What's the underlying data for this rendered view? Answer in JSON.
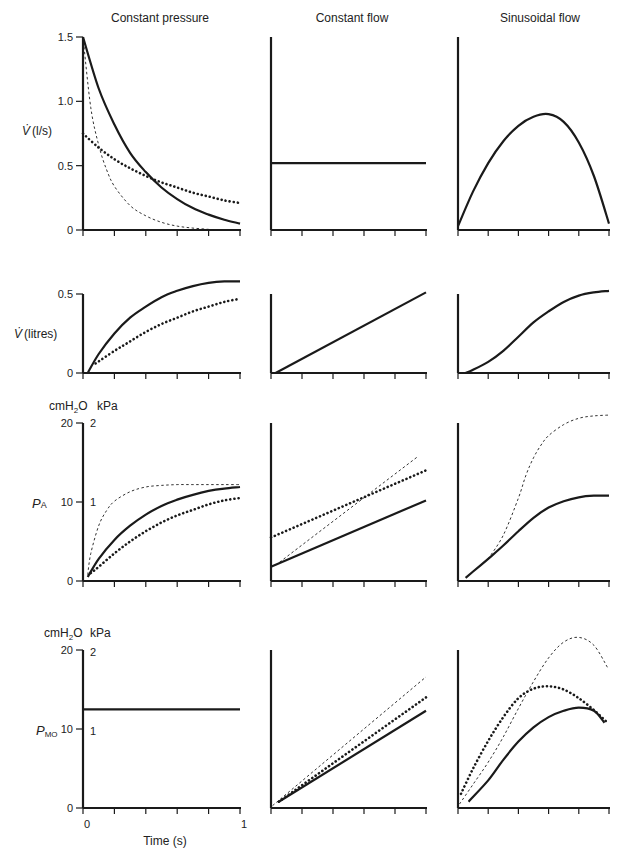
{
  "figure": {
    "column_titles": [
      "Constant pressure",
      "Constant flow",
      "Sinusoidal flow"
    ],
    "x_axis": {
      "label": "Time (s)",
      "tick_min_label": "0",
      "tick_max_label": "1",
      "ticks": 6
    },
    "row_labels": [
      {
        "main": "V̇ (l/s)",
        "units_left": "",
        "units_right": ""
      },
      {
        "main": "V̇ (litres)",
        "units_left": "",
        "units_right": ""
      },
      {
        "main": "P",
        "sub": "A",
        "units_left": "cmH₂O",
        "units_right": "kPa"
      },
      {
        "main": "P",
        "sub": "MO",
        "units_left": "cmH₂O",
        "units_right": "kPa"
      }
    ],
    "colors": {
      "ink": "#1a1a1a",
      "background": "#ffffff"
    }
  },
  "chart_data": {
    "type": "line",
    "title": "",
    "layout": "4 rows x 3 columns small multiples",
    "columns": [
      "Constant pressure",
      "Constant flow",
      "Sinusoidal flow"
    ],
    "xlabel": "Time (s)",
    "xlim": [
      0,
      1
    ],
    "line_styles": {
      "solid": "thick solid",
      "dotted": "thick dotted",
      "dashed": "thin dashed"
    },
    "rows": [
      {
        "ylabel": "V̇ (l/s)",
        "ylim": [
          0,
          1.5
        ],
        "yticks": [
          0,
          0.5,
          1.0,
          1.5
        ],
        "ytick_labels": [
          "0",
          "0.5",
          "1.0",
          "1.5"
        ],
        "panels": [
          {
            "series": [
              {
                "style": "solid",
                "x": [
                  0,
                  0.1,
                  0.2,
                  0.3,
                  0.4,
                  0.5,
                  0.6,
                  0.7,
                  0.8,
                  0.9,
                  1.0
                ],
                "y": [
                  1.5,
                  1.1,
                  0.82,
                  0.6,
                  0.45,
                  0.33,
                  0.24,
                  0.17,
                  0.12,
                  0.08,
                  0.05
                ]
              },
              {
                "style": "dotted",
                "x": [
                  0,
                  0.1,
                  0.2,
                  0.3,
                  0.4,
                  0.5,
                  0.6,
                  0.7,
                  0.8,
                  0.9,
                  1.0
                ],
                "y": [
                  0.75,
                  0.64,
                  0.55,
                  0.48,
                  0.42,
                  0.37,
                  0.33,
                  0.29,
                  0.26,
                  0.23,
                  0.21
                ]
              },
              {
                "style": "dashed",
                "x": [
                  0,
                  0.05,
                  0.1,
                  0.15,
                  0.2,
                  0.3,
                  0.4,
                  0.5,
                  0.6,
                  0.7,
                  0.8,
                  0.85
                ],
                "y": [
                  1.5,
                  0.95,
                  0.66,
                  0.47,
                  0.34,
                  0.19,
                  0.11,
                  0.06,
                  0.03,
                  0.015,
                  0.005,
                  0
                ]
              }
            ]
          },
          {
            "series": [
              {
                "style": "solid",
                "x": [
                  0,
                  1
                ],
                "y": [
                  0.52,
                  0.52
                ]
              }
            ]
          },
          {
            "series": [
              {
                "style": "solid",
                "x": [
                  0,
                  0.1,
                  0.2,
                  0.3,
                  0.4,
                  0.5,
                  0.6,
                  0.7,
                  0.8,
                  0.9,
                  1.0
                ],
                "y": [
                  0.03,
                  0.3,
                  0.52,
                  0.69,
                  0.81,
                  0.88,
                  0.9,
                  0.84,
                  0.68,
                  0.42,
                  0.05
                ]
              }
            ]
          }
        ]
      },
      {
        "ylabel": "V̇ (litres)",
        "ylim": [
          0,
          0.5
        ],
        "yticks": [
          0,
          0.5
        ],
        "ytick_labels": [
          "0",
          "0.5"
        ],
        "panels": [
          {
            "series": [
              {
                "style": "solid",
                "x": [
                  0.03,
                  0.1,
                  0.2,
                  0.3,
                  0.4,
                  0.5,
                  0.6,
                  0.7,
                  0.8,
                  0.9,
                  1.0
                ],
                "y": [
                  0.0,
                  0.12,
                  0.25,
                  0.35,
                  0.42,
                  0.48,
                  0.52,
                  0.55,
                  0.57,
                  0.58,
                  0.58
                ]
              },
              {
                "style": "dotted",
                "x": [
                  0.08,
                  0.2,
                  0.3,
                  0.4,
                  0.5,
                  0.6,
                  0.7,
                  0.8,
                  0.9,
                  1.0
                ],
                "y": [
                  0.06,
                  0.14,
                  0.2,
                  0.26,
                  0.31,
                  0.35,
                  0.39,
                  0.42,
                  0.45,
                  0.47
                ]
              }
            ]
          },
          {
            "series": [
              {
                "style": "solid",
                "x": [
                  0.03,
                  1
                ],
                "y": [
                  0,
                  0.51
                ]
              }
            ]
          },
          {
            "series": [
              {
                "style": "solid",
                "x": [
                  0.05,
                  0.1,
                  0.2,
                  0.3,
                  0.4,
                  0.5,
                  0.6,
                  0.7,
                  0.8,
                  0.9,
                  1.0
                ],
                "y": [
                  0,
                  0.02,
                  0.07,
                  0.14,
                  0.23,
                  0.32,
                  0.39,
                  0.45,
                  0.49,
                  0.51,
                  0.52
                ]
              }
            ]
          }
        ]
      },
      {
        "ylabel": "PA",
        "ylabel_units": [
          "cmH2O",
          "kPa"
        ],
        "ylim": [
          0,
          20
        ],
        "yticks": [
          0,
          10,
          20
        ],
        "ytick_labels": [
          "0",
          "10",
          "20"
        ],
        "ytick_labels_right": [
          "",
          "1",
          "2"
        ],
        "panels": [
          {
            "series": [
              {
                "style": "solid",
                "x": [
                  0.03,
                  0.1,
                  0.2,
                  0.3,
                  0.4,
                  0.5,
                  0.6,
                  0.7,
                  0.8,
                  0.9,
                  1.0
                ],
                "y": [
                  0.5,
                  2.8,
                  5.2,
                  7.0,
                  8.4,
                  9.5,
                  10.3,
                  10.9,
                  11.4,
                  11.7,
                  11.9
                ]
              },
              {
                "style": "dotted",
                "x": [
                  0.05,
                  0.1,
                  0.2,
                  0.3,
                  0.4,
                  0.5,
                  0.6,
                  0.7,
                  0.8,
                  0.9,
                  1.0
                ],
                "y": [
                  1.0,
                  1.8,
                  3.5,
                  5.0,
                  6.3,
                  7.4,
                  8.3,
                  9.0,
                  9.7,
                  10.2,
                  10.5
                ]
              },
              {
                "style": "dashed",
                "x": [
                  0.03,
                  0.05,
                  0.1,
                  0.15,
                  0.2,
                  0.3,
                  0.4,
                  0.5,
                  0.6,
                  0.7,
                  0.8,
                  0.9,
                  1.0
                ],
                "y": [
                  0.8,
                  3.5,
                  7.0,
                  8.9,
                  10.1,
                  11.3,
                  11.9,
                  12.1,
                  12.2,
                  12.2,
                  12.2,
                  12.2,
                  12.2
                ]
              }
            ]
          },
          {
            "series": [
              {
                "style": "solid",
                "x": [
                  0,
                  1
                ],
                "y": [
                  1.8,
                  10.2
                ]
              },
              {
                "style": "dotted",
                "x": [
                  0,
                  1
                ],
                "y": [
                  5.5,
                  14.0
                ]
              },
              {
                "style": "dashed",
                "x": [
                  0.03,
                  0.95
                ],
                "y": [
                  2.0,
                  15.8
                ]
              }
            ]
          },
          {
            "series": [
              {
                "style": "solid",
                "x": [
                  0.05,
                  0.1,
                  0.2,
                  0.3,
                  0.4,
                  0.5,
                  0.6,
                  0.7,
                  0.8,
                  0.9,
                  1.0
                ],
                "y": [
                  0.4,
                  1.2,
                  2.8,
                  4.5,
                  6.3,
                  8.0,
                  9.3,
                  10.1,
                  10.6,
                  10.8,
                  10.8
                ]
              },
              {
                "style": "dashed",
                "x": [
                  0.2,
                  0.3,
                  0.4,
                  0.45,
                  0.5,
                  0.55,
                  0.6,
                  0.7,
                  0.8,
                  0.9,
                  1.0
                ],
                "y": [
                  2.8,
                  5.8,
                  10.5,
                  13.4,
                  15.6,
                  17.2,
                  18.4,
                  19.8,
                  20.6,
                  20.9,
                  21.0
                ]
              }
            ]
          }
        ]
      },
      {
        "ylabel": "PMO",
        "ylabel_units": [
          "cmH2O",
          "kPa"
        ],
        "ylim": [
          0,
          20
        ],
        "yticks": [
          0,
          10,
          20
        ],
        "ytick_labels": [
          "0",
          "10",
          "20"
        ],
        "ytick_labels_right": [
          "",
          "1",
          "2"
        ],
        "panels": [
          {
            "series": [
              {
                "style": "solid",
                "x": [
                  0,
                  1
                ],
                "y": [
                  12.5,
                  12.5
                ]
              }
            ]
          },
          {
            "series": [
              {
                "style": "solid",
                "x": [
                  0.05,
                  1
                ],
                "y": [
                  0.8,
                  12.3
                ]
              },
              {
                "style": "dotted",
                "x": [
                  0.05,
                  1
                ],
                "y": [
                  0.8,
                  14.0
                ]
              },
              {
                "style": "dashed",
                "x": [
                  0.01,
                  1
                ],
                "y": [
                  0.3,
                  16.6
                ]
              }
            ]
          },
          {
            "series": [
              {
                "style": "solid",
                "x": [
                  0.07,
                  0.2,
                  0.3,
                  0.4,
                  0.5,
                  0.6,
                  0.7,
                  0.8,
                  0.9,
                  0.97
                ],
                "y": [
                  0.8,
                  3.5,
                  6.1,
                  8.4,
                  10.2,
                  11.5,
                  12.3,
                  12.7,
                  12.3,
                  10.8
                ]
              },
              {
                "style": "dotted",
                "x": [
                  0.02,
                  0.1,
                  0.2,
                  0.3,
                  0.4,
                  0.5,
                  0.6,
                  0.7,
                  0.8,
                  0.9,
                  0.99
                ],
                "y": [
                  1.8,
                  5.0,
                  8.5,
                  11.5,
                  13.9,
                  15.1,
                  15.4,
                  15.0,
                  13.9,
                  12.4,
                  10.8
                ]
              },
              {
                "style": "dashed",
                "x": [
                  0.01,
                  0.1,
                  0.2,
                  0.3,
                  0.4,
                  0.5,
                  0.6,
                  0.7,
                  0.8,
                  0.9,
                  0.99
                ],
                "y": [
                  0.5,
                  3.0,
                  5.8,
                  9.0,
                  12.6,
                  16.0,
                  19.0,
                  21.0,
                  21.6,
                  20.6,
                  17.8
                ]
              }
            ]
          }
        ]
      }
    ]
  }
}
